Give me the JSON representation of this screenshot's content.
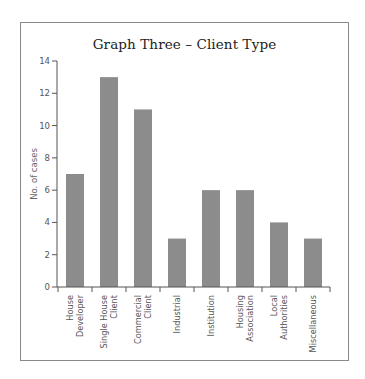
{
  "chart_data": {
    "type": "bar",
    "title": "Graph Three – Client Type",
    "xlabel": "",
    "ylabel": "No. of cases",
    "ylim": [
      0,
      14
    ],
    "yticks": [
      0,
      2,
      4,
      6,
      8,
      10,
      12,
      14
    ],
    "grid": false,
    "legend": null,
    "categories": [
      "House Developer",
      "Single House Client",
      "Commercial Client",
      "Industrial",
      "Institution",
      "Housing Association",
      "Local Authorities",
      "Miscellaneous"
    ],
    "category_label_lines": [
      [
        "House",
        "Developer"
      ],
      [
        "Single House",
        "Client"
      ],
      [
        "Commercial",
        "Client"
      ],
      [
        "Industrial"
      ],
      [
        "Institution"
      ],
      [
        "Housing",
        "Association"
      ],
      [
        "Local",
        "Authorities"
      ],
      [
        "Miscellaneous"
      ]
    ],
    "values": [
      7,
      13,
      11,
      3,
      6,
      6,
      4,
      3
    ],
    "bar_color": "#8c8c8c"
  }
}
